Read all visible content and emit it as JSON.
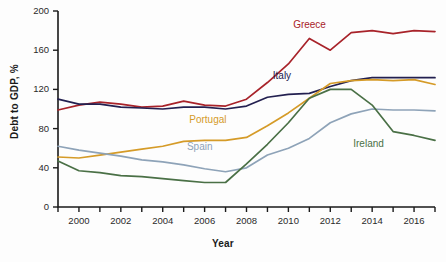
{
  "chart_data": {
    "type": "line",
    "title": "",
    "xlabel": "Year",
    "ylabel": "Debt to GDP, %",
    "xlim": [
      1999,
      2017
    ],
    "ylim": [
      0,
      200
    ],
    "grid": false,
    "legend_position": "inline-labels",
    "x": [
      1999,
      2000,
      2001,
      2002,
      2003,
      2004,
      2005,
      2006,
      2007,
      2008,
      2009,
      2010,
      2011,
      2012,
      2013,
      2014,
      2015,
      2016,
      2017
    ],
    "y_ticks": [
      0,
      40,
      80,
      120,
      160,
      200
    ],
    "y_tick_labels": [
      "0",
      "40",
      "80",
      "120",
      "160",
      "200"
    ],
    "x_ticks": [
      1999,
      2000,
      2001,
      2002,
      2003,
      2004,
      2005,
      2006,
      2007,
      2008,
      2009,
      2010,
      2011,
      2012,
      2013,
      2014,
      2015,
      2016,
      2017
    ],
    "x_tick_labels": [
      "",
      "2000",
      "",
      "2002",
      "",
      "2004",
      "",
      "2006",
      "",
      "2008",
      "",
      "2010",
      "",
      "2012",
      "",
      "2014",
      "",
      "2016",
      ""
    ],
    "series": [
      {
        "name": "Greece",
        "color": "#a8232a",
        "label_x": 2011.0,
        "label_y": 185,
        "values": [
          99,
          104,
          107,
          105,
          102,
          103,
          108,
          104,
          103,
          110,
          127,
          146,
          172,
          160,
          178,
          180,
          177,
          180,
          179
        ]
      },
      {
        "name": "Italy",
        "color": "#232050",
        "label_x": 2009.9,
        "label_y": 133,
        "values": [
          110,
          105,
          105,
          102,
          101,
          100,
          102,
          102,
          100,
          103,
          112,
          115,
          116,
          123,
          129,
          132,
          132,
          132,
          132
        ]
      },
      {
        "name": "Portugal",
        "color": "#d59b28",
        "label_x": 2006.3,
        "label_y": 88,
        "values": [
          51,
          50,
          53,
          56,
          59,
          62,
          67,
          68,
          68,
          71,
          83,
          96,
          111,
          126,
          129,
          130,
          129,
          130,
          125
        ]
      },
      {
        "name": "Spain",
        "color": "#8ea3b8",
        "label_x": 2005.8,
        "label_y": 60,
        "values": [
          62,
          58,
          55,
          52,
          48,
          46,
          43,
          39,
          36,
          40,
          53,
          60,
          70,
          86,
          95,
          100,
          99,
          99,
          98
        ]
      },
      {
        "name": "Ireland",
        "color": "#4a7046",
        "label_x": 2014.0,
        "label_y": 63,
        "values": [
          47,
          37,
          35,
          32,
          31,
          29,
          27,
          25,
          25,
          44,
          64,
          86,
          111,
          120,
          120,
          104,
          77,
          73,
          68
        ]
      }
    ]
  }
}
